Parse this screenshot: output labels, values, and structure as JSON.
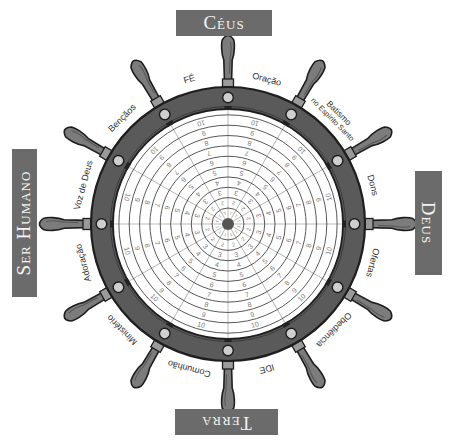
{
  "title_boxes": {
    "top": "Céus",
    "right": "Deus",
    "bottom": "Terra",
    "left": "Ser Humano"
  },
  "sector_labels": [
    {
      "text": "FÉ",
      "angle": -15
    },
    {
      "text": "Oração",
      "angle": 15
    },
    {
      "line1": "Batismo",
      "line2": "no Espírito Santo",
      "angle": 45
    },
    {
      "text": "Dons",
      "angle": 75
    },
    {
      "text": "Ofertas",
      "angle": 105
    },
    {
      "text": "Obediência",
      "angle": 135
    },
    {
      "text": "IDE",
      "angle": 165
    },
    {
      "text": "Comunhão",
      "angle": 195
    },
    {
      "text": "Ministério",
      "angle": 225
    },
    {
      "text": "Adoração",
      "angle": 255
    },
    {
      "text": "Voz de Deus",
      "angle": 285
    },
    {
      "text": "Bençãos",
      "angle": 315
    }
  ],
  "dial": {
    "sectors": 12,
    "scale": [
      "1",
      "2",
      "3",
      "4",
      "5",
      "6",
      "7",
      "8",
      "9",
      "10"
    ]
  },
  "colors": {
    "title_box": "#6b6b6b",
    "ring": "#5a5a5a",
    "outline": "#1e1e1e",
    "handle": "#7c7c7c",
    "bolt": "#cfcfcf",
    "dial_ring_line": "#444444",
    "dial_radial_line": "#8f8f8f",
    "dial_number": "#7a7a7a",
    "label_text": "#333333"
  }
}
